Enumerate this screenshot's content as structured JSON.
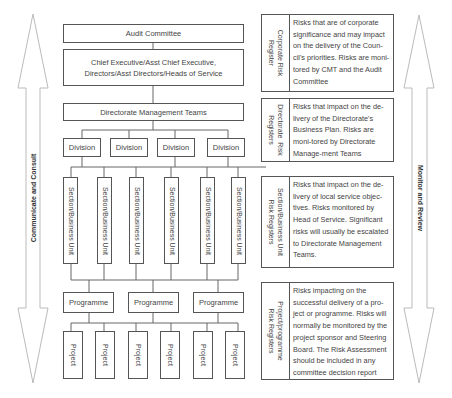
{
  "left_arrow": {
    "label": "Communicate and Consult",
    "direction": "bidirectional"
  },
  "right_arrow": {
    "label": "Monitor  and Review",
    "direction": "bidirectional"
  },
  "hierarchy": {
    "audit_committee": "Audit Committee",
    "chief_executive": "Chief Executive/Asst Chief Executive, Directors/Asst Directors/Heads of Service",
    "directorate": "Directorate Management Teams",
    "divisions": [
      "Division",
      "Division",
      "Division",
      "Division"
    ],
    "sections": [
      "Section/Business Unit",
      "Section/Business Unit",
      "Section/Business Unit",
      "Section/Business Unit",
      "Section/Business Unit",
      "Section/Business Unit"
    ],
    "programmes": [
      "Programme",
      "Programme",
      "Programme"
    ],
    "projects": [
      "Project",
      "Project",
      "Project",
      "Project",
      "Project",
      "Project"
    ]
  },
  "registers": [
    {
      "label": "Corporate Risk\nRegister",
      "text": "Risks that are of corporate significance and may impact on the delivery of the Coun-cil's priorities. Risks are moni-tored by CMT and the Audit Committee"
    },
    {
      "label": "Directorate  Risk\nRegisters",
      "text": "Risks that impact on the de-livery of the Directorate's Business Plan. Risks are moni-tored by Directorate Manage-ment Teams"
    },
    {
      "label": "Section/Business Unit\nRisk Registers",
      "text": "Risks that impact on the de-livery of local service objec-tives. Risks monitored by Head of Service. Significant risks will usually be escalated to Directorate Management Teams."
    },
    {
      "label": "Project/programme\nRisk Registers",
      "text": "Risks impacting on the successful delivery of a pro-ject or programme. Risks will normally be monitored by the project sponsor and Steering Board. The Risk Assessment should be included in any committee decision report"
    }
  ]
}
